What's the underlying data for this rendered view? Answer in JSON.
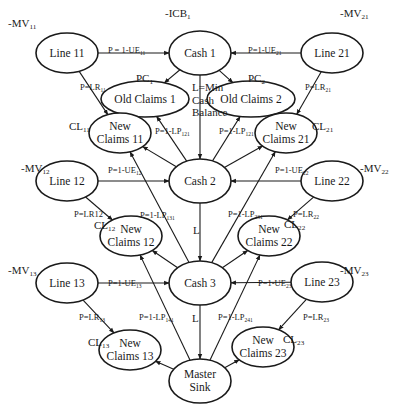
{
  "diagram": {
    "type": "network-flow",
    "nodes": [
      {
        "id": "line11",
        "label": "Line 11",
        "cx": 67,
        "cy": 53,
        "rx": 31,
        "ry": 20
      },
      {
        "id": "cash1",
        "label": "Cash 1",
        "cx": 200,
        "cy": 53,
        "rx": 31,
        "ry": 22
      },
      {
        "id": "line21",
        "label": "Line 21",
        "cx": 332,
        "cy": 53,
        "rx": 31,
        "ry": 20
      },
      {
        "id": "old1",
        "label": "Old Claims 1",
        "cx": 145,
        "cy": 99,
        "rx": 44,
        "ry": 18
      },
      {
        "id": "old2",
        "label": "Old Claims 2",
        "cx": 251,
        "cy": 99,
        "rx": 44,
        "ry": 18
      },
      {
        "id": "new11",
        "label": "New\nClaims 11",
        "cx": 120,
        "cy": 133,
        "rx": 31,
        "ry": 20
      },
      {
        "id": "new21",
        "label": "New\nClaims 21",
        "cx": 286,
        "cy": 133,
        "rx": 31,
        "ry": 20
      },
      {
        "id": "line12",
        "label": "Line 12",
        "cx": 67,
        "cy": 181,
        "rx": 31,
        "ry": 20
      },
      {
        "id": "cash2",
        "label": "Cash 2",
        "cx": 200,
        "cy": 181,
        "rx": 31,
        "ry": 22
      },
      {
        "id": "line22",
        "label": "Line 22",
        "cx": 332,
        "cy": 181,
        "rx": 31,
        "ry": 20
      },
      {
        "id": "new12",
        "label": "New\nClaims 12",
        "cx": 131,
        "cy": 236,
        "rx": 31,
        "ry": 20
      },
      {
        "id": "new22",
        "label": "New\nClaims 22",
        "cx": 269,
        "cy": 236,
        "rx": 31,
        "ry": 20
      },
      {
        "id": "line13",
        "label": "Line 13",
        "cx": 67,
        "cy": 283,
        "rx": 31,
        "ry": 20
      },
      {
        "id": "cash3",
        "label": "Cash 3",
        "cx": 200,
        "cy": 283,
        "rx": 31,
        "ry": 22
      },
      {
        "id": "line23",
        "label": "Line 23",
        "cx": 322,
        "cy": 282,
        "rx": 31,
        "ry": 20
      },
      {
        "id": "new13",
        "label": "New\nClaims 13",
        "cx": 130,
        "cy": 350,
        "rx": 31,
        "ry": 20
      },
      {
        "id": "new23",
        "label": "New\nClaims 23",
        "cx": 263,
        "cy": 347,
        "rx": 31,
        "ry": 20
      },
      {
        "id": "sink",
        "label": "Master\nSink",
        "cx": 200,
        "cy": 381,
        "rx": 31,
        "ry": 22
      }
    ],
    "edges": [
      {
        "from": "line11",
        "to": "cash1",
        "label": "P = 1-UE",
        "sub": "11"
      },
      {
        "from": "line21",
        "to": "cash1",
        "label": "P=1-UE",
        "sub": "21"
      },
      {
        "from": "line11",
        "to": "new11",
        "label": "P=LR",
        "sub": "11"
      },
      {
        "from": "line21",
        "to": "new21",
        "label": "P=LR",
        "sub": "21"
      },
      {
        "from": "cash1",
        "to": "old1",
        "label": "",
        "sub": ""
      },
      {
        "from": "cash1",
        "to": "old2",
        "label": "",
        "sub": ""
      },
      {
        "from": "cash1",
        "to": "cash2",
        "label": "L=Min Cash Balance",
        "sub": ""
      },
      {
        "from": "cash2",
        "to": "old1",
        "label": "P=1-LP",
        "sub": "121"
      },
      {
        "from": "cash2",
        "to": "old2",
        "label": "P=1-LP",
        "sub": "121"
      },
      {
        "from": "cash2",
        "to": "new11",
        "label": "",
        "sub": ""
      },
      {
        "from": "cash2",
        "to": "new21",
        "label": "",
        "sub": ""
      },
      {
        "from": "line12",
        "to": "cash2",
        "label": "P=1-UE",
        "sub": "12"
      },
      {
        "from": "line22",
        "to": "cash2",
        "label": "P=1-UE",
        "sub": "22"
      },
      {
        "from": "line12",
        "to": "new12",
        "label": "P=LR12",
        "sub": ""
      },
      {
        "from": "line22",
        "to": "new22",
        "label": "P=LR",
        "sub": "22"
      },
      {
        "from": "cash2",
        "to": "cash3",
        "label": "L",
        "sub": ""
      },
      {
        "from": "cash3",
        "to": "new11",
        "label": "P=1-LP",
        "sub": "131"
      },
      {
        "from": "cash3",
        "to": "new21",
        "label": "P=1-LP",
        "sub": "231"
      },
      {
        "from": "cash3",
        "to": "new12",
        "label": "",
        "sub": ""
      },
      {
        "from": "cash3",
        "to": "new22",
        "label": "",
        "sub": ""
      },
      {
        "from": "line13",
        "to": "cash3",
        "label": "P=1-UE",
        "sub": "13"
      },
      {
        "from": "line23",
        "to": "cash3",
        "label": "P=1-UE",
        "sub": "23"
      },
      {
        "from": "line13",
        "to": "new13",
        "label": "P=LR",
        "sub": "13"
      },
      {
        "from": "line23",
        "to": "new23",
        "label": "P=LR",
        "sub": "23"
      },
      {
        "from": "cash3",
        "to": "sink",
        "label": "L",
        "sub": ""
      },
      {
        "from": "sink",
        "to": "new12",
        "label": "P=1-LP",
        "sub": "141"
      },
      {
        "from": "sink",
        "to": "new22",
        "label": "P=1-LP",
        "sub": "241"
      },
      {
        "from": "sink",
        "to": "new13",
        "label": "",
        "sub": ""
      },
      {
        "from": "sink",
        "to": "new23",
        "label": "",
        "sub": ""
      }
    ],
    "outer_labels": [
      {
        "id": "mv11",
        "base": "-MV",
        "sub": "11",
        "x": 8,
        "y": 18
      },
      {
        "id": "icb1",
        "base": "-ICB",
        "sub": "1",
        "x": 165,
        "y": 8
      },
      {
        "id": "mv21",
        "base": "-MV",
        "sub": "21",
        "x": 340,
        "y": 8
      },
      {
        "id": "pc1",
        "base": "PC",
        "sub": "1",
        "x": 136,
        "y": 73
      },
      {
        "id": "pc2",
        "base": "PC",
        "sub": "2",
        "x": 248,
        "y": 73
      },
      {
        "id": "cl11",
        "base": "CL",
        "sub": "11",
        "x": 69,
        "y": 121
      },
      {
        "id": "cl21",
        "base": "CL",
        "sub": "21",
        "x": 312,
        "y": 121
      },
      {
        "id": "mv12",
        "base": "-MV",
        "sub": "12",
        "x": 21,
        "y": 163
      },
      {
        "id": "mv22",
        "base": "-MV",
        "sub": "22",
        "x": 360,
        "y": 163
      },
      {
        "id": "cl12",
        "base": "CL",
        "sub": "12",
        "x": 94,
        "y": 220
      },
      {
        "id": "cl22",
        "base": "CL",
        "sub": "22",
        "x": 284,
        "y": 219
      },
      {
        "id": "mv13",
        "base": "-MV",
        "sub": "13",
        "x": 8,
        "y": 265
      },
      {
        "id": "mv23",
        "base": "-MV",
        "sub": "23",
        "x": 340,
        "y": 265
      },
      {
        "id": "cl13",
        "base": "CL",
        "sub": "13",
        "x": 88,
        "y": 337
      },
      {
        "id": "cl23",
        "base": "CL",
        "sub": "23",
        "x": 283,
        "y": 334
      }
    ],
    "edge_labels": [
      {
        "id": "e-line11-cash1",
        "base": "P = 1-UE",
        "sub": "11",
        "x": 108,
        "y": 46
      },
      {
        "id": "e-line21-cash1",
        "base": "P=1-UE",
        "sub": "21",
        "x": 248,
        "y": 46
      },
      {
        "id": "e-line11-new11",
        "base": "P=LR",
        "sub": "11",
        "x": 80,
        "y": 83
      },
      {
        "id": "e-line21-new21",
        "base": "P=LR",
        "sub": "21",
        "x": 305,
        "y": 83
      },
      {
        "id": "e-cash2-old1",
        "base": "P=1-LP",
        "sub": "121",
        "x": 155,
        "y": 127
      },
      {
        "id": "e-cash2-old2",
        "base": "P=1-LP",
        "sub": "121",
        "x": 219,
        "y": 127
      },
      {
        "id": "e-line12-cash2",
        "base": "P=1-UE",
        "sub": "12",
        "x": 108,
        "y": 166
      },
      {
        "id": "e-line22-cash2",
        "base": "P=1-UE",
        "sub": "22",
        "x": 275,
        "y": 166
      },
      {
        "id": "e-line12-new12",
        "base": "P=LR12",
        "sub": "",
        "x": 74,
        "y": 210
      },
      {
        "id": "e-line22-new22",
        "base": "P=LR",
        "sub": "22",
        "x": 293,
        "y": 210
      },
      {
        "id": "e-cash3-new11",
        "base": "P=1-LP",
        "sub": "131",
        "x": 140,
        "y": 211
      },
      {
        "id": "e-cash3-new21",
        "base": "P=1-LP",
        "sub": "231",
        "x": 228,
        "y": 210
      },
      {
        "id": "e-line13-cash3",
        "base": "P=1-UE",
        "sub": "13",
        "x": 108,
        "y": 279
      },
      {
        "id": "e-line23-cash3",
        "base": "P=1-UE",
        "sub": "23",
        "x": 258,
        "y": 279
      },
      {
        "id": "e-line13-new13",
        "base": "P=LR",
        "sub": "13",
        "x": 79,
        "y": 313
      },
      {
        "id": "e-line23-new23",
        "base": "P=LR",
        "sub": "23",
        "x": 303,
        "y": 313
      },
      {
        "id": "e-sink-new12",
        "base": "P=1-LP",
        "sub": "141",
        "x": 139,
        "y": 313
      },
      {
        "id": "e-sink-new22",
        "base": "P=1-LP",
        "sub": "241",
        "x": 218,
        "y": 313
      }
    ],
    "flow_labels": {
      "cash1_cash2": {
        "lines": [
          "L=Min",
          "Cash",
          "Balance"
        ],
        "x": 192,
        "y": 81
      },
      "cash2_cash3": {
        "text": "L",
        "x": 193,
        "y": 225
      },
      "cash3_sink": {
        "text": "L",
        "x": 192,
        "y": 313
      }
    }
  },
  "colors": {
    "stroke": "#1a1a1a",
    "background": "#ffffff"
  }
}
